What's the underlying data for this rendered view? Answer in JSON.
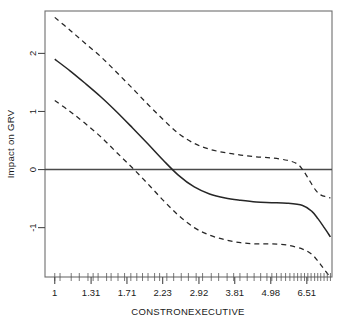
{
  "chart_data": {
    "type": "line",
    "title": "",
    "subtitle": "",
    "xlabel": "CONSTRONEXECUTIVE",
    "ylabel": "Impact on GRV",
    "xscale": "log",
    "xlim": [
      0.93,
      7.85
    ],
    "ylim": [
      -1.85,
      2.73
    ],
    "grid": false,
    "legend": "none",
    "zero_reference_line": 0,
    "x_tick_labels": [
      "1",
      "1.31",
      "1.71",
      "2.23",
      "2.92",
      "3.81",
      "4.98",
      "6.51"
    ],
    "x_tick_values": [
      1,
      1.31,
      1.71,
      2.23,
      2.92,
      3.81,
      4.98,
      6.51
    ],
    "y_tick_labels": [
      "2",
      "1",
      "0",
      "-1"
    ],
    "y_tick_values": [
      2,
      1,
      0,
      -1
    ],
    "series": [
      {
        "name": "fit",
        "style": "solid",
        "color": "#262626",
        "x": [
          1.0,
          1.12,
          1.25,
          1.41,
          1.58,
          1.78,
          2.0,
          2.24,
          2.51,
          2.82,
          3.16,
          3.55,
          3.98,
          4.47,
          5.01,
          5.62,
          6.31,
          6.76,
          7.08,
          7.41,
          7.76
        ],
        "values": [
          1.9,
          1.7,
          1.49,
          1.25,
          1.0,
          0.72,
          0.44,
          0.16,
          -0.1,
          -0.3,
          -0.42,
          -0.49,
          -0.53,
          -0.56,
          -0.57,
          -0.58,
          -0.62,
          -0.72,
          -0.85,
          -1.0,
          -1.16
        ]
      },
      {
        "name": "upper_confidence_band",
        "style": "dashed",
        "color": "#262626",
        "x": [
          1.0,
          1.12,
          1.25,
          1.41,
          1.58,
          1.78,
          2.0,
          2.24,
          2.51,
          2.82,
          3.16,
          3.55,
          3.98,
          4.47,
          5.01,
          5.62,
          6.05,
          6.31,
          6.61,
          6.96,
          7.24,
          7.53,
          7.76
        ],
        "values": [
          2.62,
          2.4,
          2.18,
          1.94,
          1.68,
          1.4,
          1.12,
          0.86,
          0.62,
          0.45,
          0.35,
          0.29,
          0.25,
          0.22,
          0.2,
          0.16,
          0.1,
          0.0,
          -0.17,
          -0.36,
          -0.44,
          -0.47,
          -0.49
        ]
      },
      {
        "name": "lower_confidence_band",
        "style": "dashed",
        "color": "#262626",
        "x": [
          1.0,
          1.12,
          1.25,
          1.41,
          1.58,
          1.78,
          2.0,
          2.24,
          2.51,
          2.82,
          3.16,
          3.55,
          3.98,
          4.47,
          5.01,
          5.62,
          6.31,
          6.76,
          7.08,
          7.41,
          7.76
        ],
        "values": [
          1.19,
          1.0,
          0.8,
          0.56,
          0.3,
          0.03,
          -0.25,
          -0.53,
          -0.79,
          -1.0,
          -1.13,
          -1.21,
          -1.26,
          -1.28,
          -1.28,
          -1.3,
          -1.37,
          -1.46,
          -1.58,
          -1.72,
          -1.86
        ]
      }
    ],
    "rug_values": [
      1.0,
      1.04,
      1.13,
      1.2,
      1.28,
      1.33,
      1.38,
      1.47,
      1.52,
      1.6,
      1.68,
      1.76,
      1.84,
      1.92,
      2.0,
      2.1,
      2.18,
      2.3,
      2.42,
      2.56,
      2.7,
      2.86,
      3.0,
      3.2,
      3.38,
      3.6,
      3.78,
      3.96,
      4.18,
      4.4,
      4.62,
      4.84,
      5.02,
      5.2,
      5.38,
      5.56,
      5.74,
      5.92,
      6.08,
      6.24,
      6.4,
      6.56,
      6.72,
      6.9,
      7.06,
      7.22,
      7.4,
      7.58,
      7.76
    ]
  },
  "axes": {
    "box_color": "#6e6e6e",
    "zero_line_color": "#4a4a4a"
  }
}
